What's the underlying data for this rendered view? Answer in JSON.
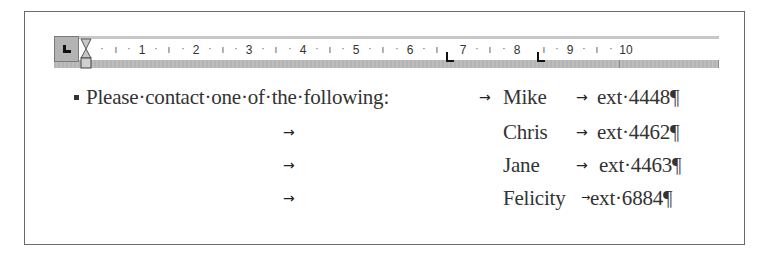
{
  "ruler": {
    "tab_selector": "left-tab",
    "labels": [
      "1",
      "2",
      "3",
      "4",
      "5",
      "6",
      "7",
      "8",
      "9",
      "10"
    ],
    "tab_stops_at": [
      "6.75",
      "8.25"
    ]
  },
  "document": {
    "lines": [
      {
        "bullet": true,
        "lead": "Please·contact·one·of·the·following:",
        "tab1": "→",
        "name": "Mike",
        "tab2": "→",
        "ext": "ext·4448",
        "pilcrow": "¶"
      },
      {
        "bullet": false,
        "lead": "",
        "tab1": "→",
        "name": "Chris",
        "tab2": "→",
        "ext": "ext·4462",
        "pilcrow": "¶"
      },
      {
        "bullet": false,
        "lead": "",
        "tab1": "→",
        "name": "Jane",
        "tab2": "→",
        "ext": "ext·4463",
        "pilcrow": "¶"
      },
      {
        "bullet": false,
        "lead": "",
        "tab1": "→",
        "name": "Felicity",
        "tab2": "→",
        "ext": "ext·6884",
        "pilcrow": "¶"
      }
    ]
  },
  "colors": {
    "text": "#333333",
    "ruler_band": "#b4b4b4",
    "frame_border": "#6a6a6a"
  }
}
